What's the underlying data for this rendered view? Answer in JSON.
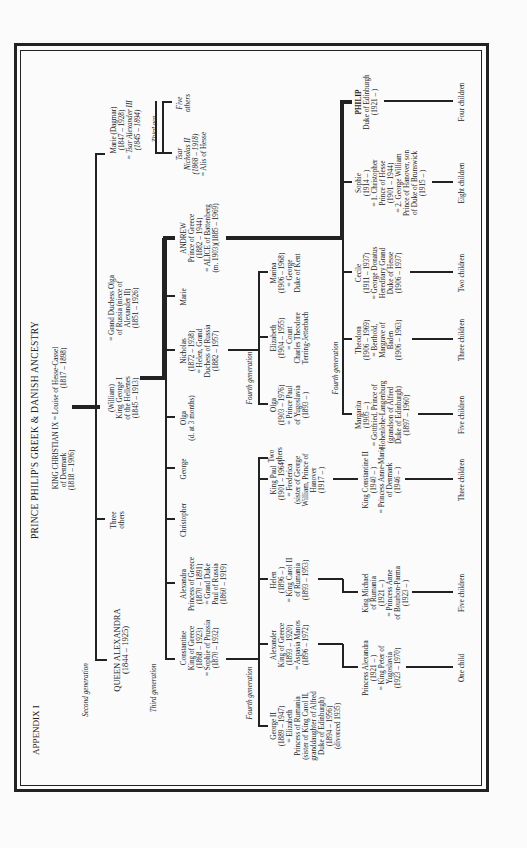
{
  "page": {
    "appendix": "APPENDIX I",
    "title": "PRINCE PHILIP'S GREEK & DANISH ANCESTRY"
  },
  "generation_labels": {
    "second": "Second generation",
    "third": "Third generation",
    "third_short": "Third gen.",
    "fourth_a": "Fourth generation",
    "fourth_b": "Fourth generation",
    "fourth_c": "Fourth generation"
  },
  "first_gen": {
    "line1": "KING CHRISTIAN IX = Louise of Hesse-Cassel",
    "line2": "of Denmark",
    "line3": "(1818 – 1906)",
    "line4": "(1817 – 1898)"
  },
  "second_gen": {
    "alexandra": {
      "name": "QUEEN ALEXANDRA",
      "dates": "(1844 – 1925)"
    },
    "three_others": {
      "l1": "Three",
      "l2": "others"
    },
    "george_i": {
      "l1": "(William)",
      "l2": "King George I",
      "l3": "of the Hellenes",
      "l4": "(1845 – 1913)"
    },
    "olga_spouse": {
      "l1": "= Grand Duchess Olga",
      "l2": "of Russia (niece of",
      "l3": "Alexander II)",
      "l4": "(1851 – 1926)"
    },
    "marie": {
      "l1": "Marie (Dagmar)",
      "l2": "(1847 – 1928)",
      "l3": "= Tsar Alexander III",
      "l4": "(1845 – 1894)"
    }
  },
  "russian_branch": {
    "nicholas_ii": {
      "l1": "Tsar",
      "l2": "Nicholas II",
      "l3": "(1868 – 1918)",
      "l4": "= Alis of Hesse"
    },
    "five_others": {
      "l1": "Five",
      "l2": "others"
    }
  },
  "third_gen": {
    "constantine": {
      "l1": "Constantine",
      "l2": "King of Greece",
      "l3": "(1868 – 1923)",
      "l4": "= Sophie of Prussia",
      "l5": "(1870 – 1932)"
    },
    "alexandra": {
      "l1": "Alexandra",
      "l2": "Princess of Greece",
      "l3": "(1870 – 1891)",
      "l4": "= Grand Duke",
      "l5": "Paul of Russia",
      "l6": "(1860 – 1919)"
    },
    "christopher": "Christopher",
    "george": "George",
    "olga": {
      "l1": "Olga",
      "l2": "(d. at 3 months)"
    },
    "nicholas": {
      "l1": "Nicholas",
      "l2": "(1872 – 1938)",
      "l3": "= Helen, Grand",
      "l4": "Duchess of Russia",
      "l5": "(1882 – 1957)"
    },
    "marie": "Marie",
    "andrew": {
      "l1": "ANDREW",
      "l2": "Prince of Greece",
      "l3": "(1882 – 1944)",
      "l4": "= ALICE of Battenberg",
      "l5": "(m. 1903)(1885 – 1969)"
    }
  },
  "fourth_gen": {
    "george_ii": {
      "l1": "George II",
      "l2": "(1889 – 1947)",
      "l3": "= Elizabeth",
      "l4": "Princess of Rumania",
      "l5": "(sister of King Carol II,",
      "l6": "granddaughter of Alfred",
      "l7": "Duke of Edinburgh)",
      "l8": "(1894 – 1956)",
      "l9": "(divorced 1935)"
    },
    "alexander": {
      "l1": "Alexander",
      "l2": "King of Greece",
      "l3": "(1893 – 1920)",
      "l4": "= Aspasia Manos",
      "l5": "(1896 – 1972)"
    },
    "helen": {
      "l1": "Helen",
      "l2": "(1896 –      )",
      "l3": "= King Carol II",
      "l4": "of Rumania",
      "l5": "(1893 – 1953)"
    },
    "paul": {
      "l1": "King Paul",
      "l2": "(1901 – 1964)",
      "l3": "= Frederica",
      "l4": "(sister of George",
      "l5": "William, Prince of",
      "l6": "Hanover",
      "l7": "(1917 –      )"
    },
    "two_others": {
      "l1": "Two",
      "l2": "others"
    },
    "olga": {
      "l1": "Olga",
      "l2": "(1903 – 1976)",
      "l3": "= Prince Paul",
      "l4": "of Yugoslavia",
      "l5": "(1893 –      )"
    },
    "elizabeth": {
      "l1": "Elizabeth",
      "l2": "(1904 – 1955)",
      "l3": "= Count",
      "l4": "Charles Theodore",
      "l5": "Terring-Jetterbach"
    },
    "marina": {
      "l1": "Marina",
      "l2": "(1906 – 1968)",
      "l3": "= George",
      "l4": "Duke of Kent"
    },
    "margarita": {
      "l1": "Margarita",
      "l2": "(1905 –      )",
      "l3": "= Gottfried, Prince of",
      "l4": "Hohenlohe-Langenburg",
      "l5": "(grandson of Alfred",
      "l6": "Duke of Edinburgh)",
      "l7": "(1897 – 1960)"
    },
    "theodora": {
      "l1": "Theodora",
      "l2": "(1906 – 1969)",
      "l3": "= Berthold,",
      "l4": "Margrave of",
      "l5": "Baden",
      "l6": "(1906 – 1963)"
    },
    "cecile": {
      "l1": "Cecile",
      "l2": "(1911 – 1937)",
      "l3": "= George Donatus",
      "l4": "Hereditary Grand",
      "l5": "Duke of Hesse",
      "l6": "(1906 – 1937)"
    },
    "sophie": {
      "l1": "Sophie",
      "l2": "(1914 –      )",
      "l3": "= 1. Christopher",
      "l4": "Prince of Hesse",
      "l5": "(1901 – 1944)",
      "l6": "= 2. George William",
      "l7": "Prince of Hanover, son",
      "l8": "of Duke of Brunswick",
      "l9": "(1915 –      )"
    },
    "philip": {
      "l1": "PHILIP",
      "l2": "Duke of Edinburgh",
      "l3": "(1921 –      )"
    }
  },
  "fifth_gen": {
    "princess_alexandra": {
      "l1": "Princess Alexandra",
      "l2": "(1921 –      )",
      "l3": "= King Peter of",
      "l4": "Yugoslavia",
      "l5": "(1923 – 1970)"
    },
    "michael": {
      "l1": "King Michael",
      "l2": "of Rumania",
      "l3": "(1921 –      )",
      "l4": "= Princess Anne",
      "l5": "of Bourbon-Parma",
      "l6": "(1923 –      )"
    },
    "constantine_ii": {
      "l1": "King Constantine II",
      "l2": "(1940 –      )",
      "l3": "= Princess Anne-Marie",
      "l4": "of Denmark",
      "l5": "(1946 –      )"
    }
  },
  "children_counts": {
    "princess_alexandra": "One child",
    "michael": "Five children",
    "constantine_ii": "Three children",
    "margarita": "Five children",
    "theodora": "Three children",
    "cecile": "Two children",
    "sophie": "Eight children",
    "philip": "Four children"
  }
}
